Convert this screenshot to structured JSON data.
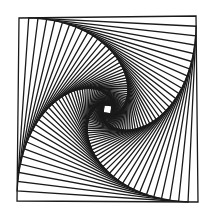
{
  "figure": {
    "kind": "nested-rotating-squares-spiral",
    "background": "#ffffff",
    "stroke_color": "#1a1a1a",
    "stroke_width": 1.3,
    "outer_square": [
      [
        19,
        18
      ],
      [
        196,
        16
      ],
      [
        198,
        202
      ],
      [
        17,
        201
      ]
    ],
    "lerp_ratio": 0.055,
    "iterations": 58
  }
}
